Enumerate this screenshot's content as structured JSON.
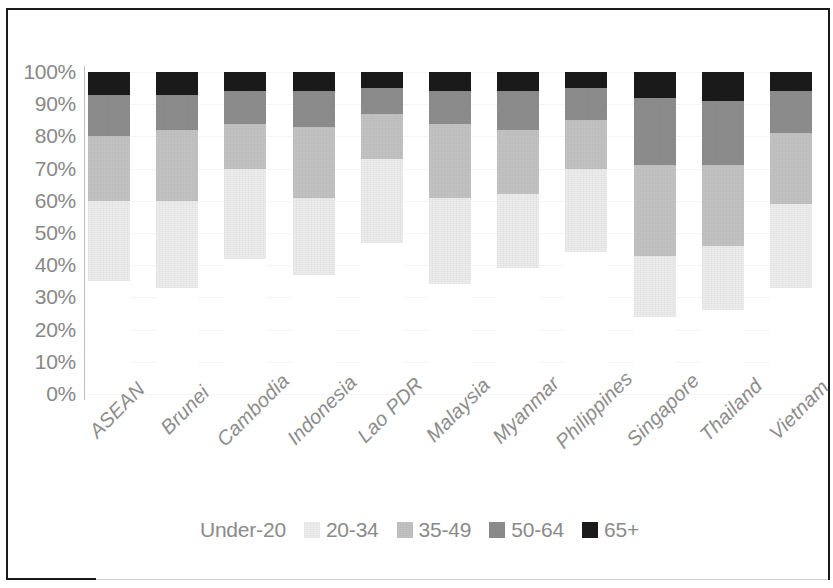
{
  "chart_data": {
    "type": "bar",
    "subtype": "stacked-percentage-column",
    "title": "",
    "subtitle": "",
    "xlabel": "",
    "ylabel": "",
    "ylim": [
      0,
      100
    ],
    "yticks": [
      "0%",
      "10%",
      "20%",
      "30%",
      "40%",
      "50%",
      "60%",
      "70%",
      "80%",
      "90%",
      "100%"
    ],
    "ytick_values": [
      0,
      10,
      20,
      30,
      40,
      50,
      60,
      70,
      80,
      90,
      100
    ],
    "grid": true,
    "legend_position": "bottom",
    "stack_order_bottom_to_top": [
      "Under-20",
      "20-34",
      "35-49",
      "50-64",
      "65+"
    ],
    "categories": [
      "ASEAN",
      "Brunei",
      "Cambodia",
      "Indonesia",
      "Lao PDR",
      "Malaysia",
      "Myanmar",
      "Philippines",
      "Singapore",
      "Thailand",
      "Vietnam"
    ],
    "series": [
      {
        "name": "Under-20",
        "color": "#ffffff",
        "values": [
          35,
          33,
          42,
          37,
          47,
          34,
          39,
          44,
          24,
          26,
          33
        ]
      },
      {
        "name": "20-34",
        "color": "#ededed",
        "values": [
          25,
          27,
          28,
          24,
          26,
          27,
          23,
          26,
          19,
          20,
          26
        ]
      },
      {
        "name": "35-49",
        "color": "#c2c2c2",
        "values": [
          20,
          22,
          14,
          22,
          14,
          23,
          20,
          15,
          28,
          25,
          22
        ]
      },
      {
        "name": "50-64",
        "color": "#8c8c8c",
        "values": [
          13,
          11,
          10,
          11,
          8,
          10,
          12,
          10,
          21,
          20,
          13
        ]
      },
      {
        "name": "65+",
        "color": "#1a1a1a",
        "values": [
          7,
          7,
          6,
          6,
          5,
          6,
          6,
          5,
          8,
          9,
          6
        ]
      }
    ]
  },
  "legend": {
    "entries": [
      {
        "label": "Under-20",
        "color": "#ffffff",
        "show_swatch": false
      },
      {
        "label": "20-34",
        "color": "#ededed",
        "show_swatch": true
      },
      {
        "label": "35-49",
        "color": "#c2c2c2",
        "show_swatch": true
      },
      {
        "label": "50-64",
        "color": "#8c8c8c",
        "show_swatch": true
      },
      {
        "label": "65+",
        "color": "#1a1a1a",
        "show_swatch": true
      }
    ]
  },
  "style": {
    "background": "#ffffff",
    "frame_color": "#1a1a1a",
    "tick_label_color": "#888888",
    "category_label_color": "#8c8c8c",
    "gridline_color": "#f4f4f4"
  }
}
